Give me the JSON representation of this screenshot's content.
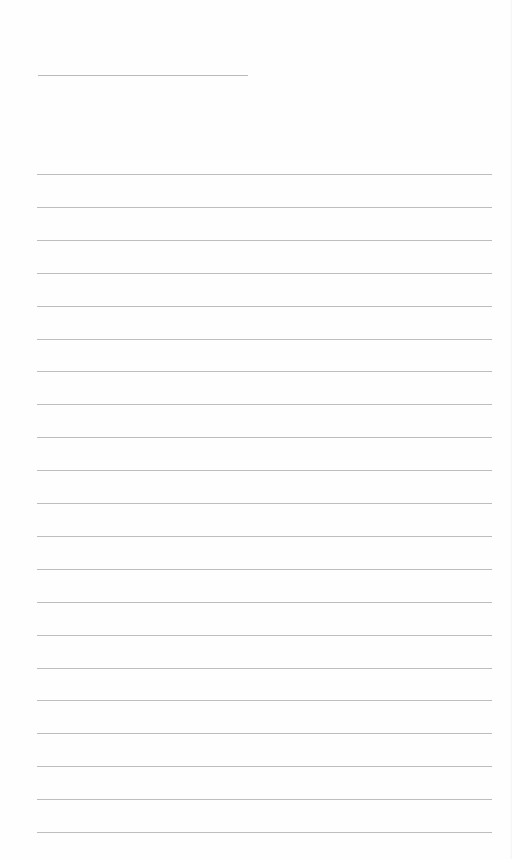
{
  "page": {
    "type": "ruled-notebook-page",
    "background": "#fefefe",
    "line_color": "#bdbdbd",
    "header_line": {
      "x": 38,
      "y": 75,
      "width": 210
    },
    "rules": {
      "count": 21,
      "x": 37,
      "width": 455,
      "first_y": 174,
      "spacing": 32.9
    }
  }
}
